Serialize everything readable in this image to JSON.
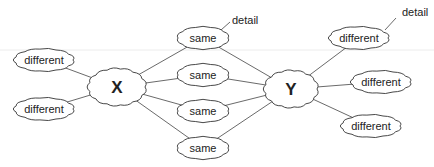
{
  "diagram": {
    "type": "concept-map",
    "hub_left": {
      "label": "X",
      "cx": 117,
      "cy": 87,
      "w": 56,
      "h": 36
    },
    "hub_right": {
      "label": "Y",
      "cx": 291,
      "cy": 89,
      "w": 52,
      "h": 36
    },
    "left_nodes": [
      {
        "label": "different",
        "cx": 44,
        "cy": 60,
        "w": 58,
        "h": 22
      },
      {
        "label": "different",
        "cx": 44,
        "cy": 109,
        "w": 58,
        "h": 22
      }
    ],
    "shared_nodes": [
      {
        "label": "same",
        "cx": 203,
        "cy": 38,
        "w": 50,
        "h": 22
      },
      {
        "label": "same",
        "cx": 203,
        "cy": 75,
        "w": 50,
        "h": 22
      },
      {
        "label": "same",
        "cx": 203,
        "cy": 111,
        "w": 50,
        "h": 22
      },
      {
        "label": "same",
        "cx": 203,
        "cy": 148,
        "w": 50,
        "h": 22
      }
    ],
    "right_nodes": [
      {
        "label": "different",
        "cx": 359,
        "cy": 38,
        "w": 58,
        "h": 22
      },
      {
        "label": "different",
        "cx": 381,
        "cy": 82,
        "w": 58,
        "h": 22
      },
      {
        "label": "different",
        "cx": 371,
        "cy": 126,
        "w": 58,
        "h": 22
      }
    ],
    "annotations": [
      {
        "label": "detail",
        "x": 232,
        "y": 24,
        "line": [
          221,
          30,
          230,
          22
        ]
      },
      {
        "label": "detail",
        "x": 402,
        "y": 16,
        "line": [
          385,
          30,
          396,
          18
        ]
      }
    ]
  }
}
